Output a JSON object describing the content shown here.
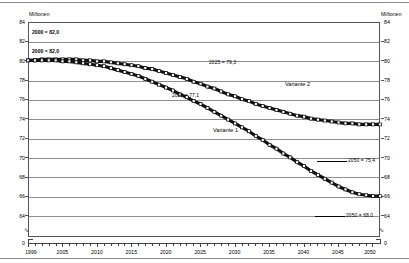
{
  "axes": {
    "unit_left": "Millionen",
    "unit_right": "Millionen",
    "y_ticks": [
      "84",
      "82",
      "80",
      "78",
      "76",
      "74",
      "72",
      "70",
      "68",
      "66",
      "64"
    ],
    "y_zero": "0",
    "x_ticks": [
      "1999",
      "2005",
      "2010",
      "2015",
      "2020",
      "2025",
      "2030",
      "2035",
      "2040",
      "2045",
      "2050"
    ]
  },
  "annotations": {
    "start_upper": "2000 = 82,0",
    "start_lower": "2000 = 82,0",
    "mid_upper": "2025 = 79,3",
    "mid_lower": "2025 = 77,1",
    "end_upper": "2050 = 75,4",
    "end_lower": "2050 = 68,0",
    "variante_1": "Variante 1",
    "variante_2": "Variante 2"
  },
  "chart_data": {
    "type": "line",
    "title": "",
    "subtitle": "",
    "xlabel": "",
    "ylabel": "Millionen",
    "xlim": [
      1999,
      2050
    ],
    "ylim": [
      64,
      84
    ],
    "grid": true,
    "legend": "inline-annotations",
    "x": [
      1999,
      2000,
      2001,
      2002,
      2003,
      2004,
      2005,
      2006,
      2007,
      2008,
      2009,
      2010,
      2011,
      2012,
      2013,
      2014,
      2015,
      2016,
      2017,
      2018,
      2019,
      2020,
      2021,
      2022,
      2023,
      2024,
      2025,
      2026,
      2027,
      2028,
      2029,
      2030,
      2031,
      2032,
      2033,
      2034,
      2035,
      2036,
      2037,
      2038,
      2039,
      2040,
      2041,
      2042,
      2043,
      2044,
      2045,
      2046,
      2047,
      2048,
      2049,
      2050
    ],
    "series": [
      {
        "name": "Variante 2",
        "values": [
          82.0,
          82.0,
          82.1,
          82.1,
          82.1,
          82.1,
          82.1,
          82.1,
          82.0,
          82.0,
          81.9,
          81.9,
          81.8,
          81.7,
          81.6,
          81.5,
          81.4,
          81.2,
          81.1,
          80.9,
          80.7,
          80.5,
          80.3,
          80.1,
          79.8,
          79.6,
          79.3,
          79.1,
          78.8,
          78.5,
          78.3,
          78.0,
          77.8,
          77.5,
          77.3,
          77.1,
          76.9,
          76.7,
          76.5,
          76.3,
          76.2,
          76.0,
          75.9,
          75.8,
          75.7,
          75.6,
          75.5,
          75.5,
          75.4,
          75.4,
          75.4,
          75.4
        ]
      },
      {
        "name": "Variante 1",
        "values": [
          82.0,
          82.0,
          82.0,
          82.0,
          82.0,
          81.9,
          81.9,
          81.8,
          81.7,
          81.6,
          81.5,
          81.4,
          81.2,
          81.0,
          80.8,
          80.6,
          80.4,
          80.1,
          79.8,
          79.5,
          79.2,
          78.9,
          78.5,
          78.2,
          77.8,
          77.5,
          77.1,
          76.7,
          76.3,
          75.9,
          75.5,
          75.1,
          74.7,
          74.2,
          73.8,
          73.3,
          72.9,
          72.4,
          72.0,
          71.5,
          71.1,
          70.6,
          70.2,
          69.8,
          69.4,
          69.0,
          68.7,
          68.4,
          68.2,
          68.1,
          68.0,
          68.0
        ]
      }
    ],
    "annotated_points": [
      {
        "series": "Variante 2",
        "x": 2000,
        "y": 82.0,
        "label": "2000 = 82,0"
      },
      {
        "series": "Variante 1",
        "x": 2000,
        "y": 82.0,
        "label": "2000 = 82,0"
      },
      {
        "series": "Variante 2",
        "x": 2025,
        "y": 79.3,
        "label": "2025 = 79,3"
      },
      {
        "series": "Variante 1",
        "x": 2025,
        "y": 77.1,
        "label": "2025 = 77,1"
      },
      {
        "series": "Variante 2",
        "x": 2050,
        "y": 75.4,
        "label": "2050 = 75,4"
      },
      {
        "series": "Variante 1",
        "x": 2050,
        "y": 68.0,
        "label": "2050 = 68,0"
      }
    ]
  }
}
